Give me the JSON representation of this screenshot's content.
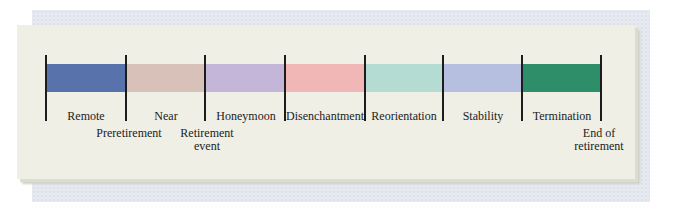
{
  "diagram": {
    "segments": [
      {
        "name": "remote",
        "label": "Remote",
        "color": "#5872ac"
      },
      {
        "name": "near",
        "label": "Near",
        "color": "#d7c1b8"
      },
      {
        "name": "honeymoon",
        "label": "Honeymoon",
        "color": "#c4b6d8"
      },
      {
        "name": "disenchantment",
        "label": "Disenchantment",
        "color": "#f1b7b6"
      },
      {
        "name": "reorientation",
        "label": "Reorientation",
        "color": "#b4dcd3"
      },
      {
        "name": "stability",
        "label": "Stability",
        "color": "#b7bfe0"
      },
      {
        "name": "termination",
        "label": "Termination",
        "color": "#2f8e6a"
      }
    ],
    "markers": [
      {
        "name": "preretirement",
        "label": "Preretirement"
      },
      {
        "name": "retirement-event",
        "label_line1": "Retirement",
        "label_line2": "event"
      },
      {
        "name": "end-of-retirement",
        "label_line1": "End of",
        "label_line2": "retirement"
      }
    ]
  }
}
